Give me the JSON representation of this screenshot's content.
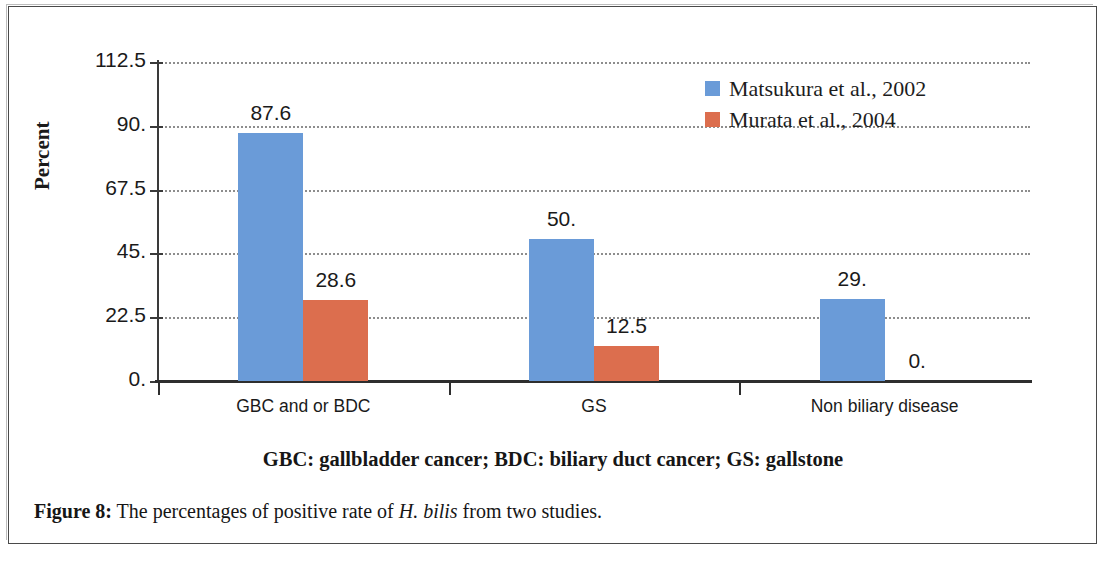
{
  "figure": {
    "caption_prefix": "Figure 8:",
    "caption_text_1": " The percentages of positive rate of ",
    "caption_italic": "H. bilis",
    "caption_text_2": " from two studies.",
    "subtitle": "GBC: gallbladder cancer; BDC: biliary duct cancer; GS: gallstone"
  },
  "chart_data": {
    "type": "bar",
    "title": "",
    "xlabel": "",
    "ylabel": "Percent",
    "ylim": [
      0,
      112.5
    ],
    "yticks": [
      "0.",
      "22.5",
      "45.",
      "67.5",
      "90.",
      "112.5"
    ],
    "ytick_values": [
      0,
      22.5,
      45,
      67.5,
      90,
      112.5
    ],
    "grid": true,
    "legend_position": "top-right",
    "categories": [
      "GBC and or BDC",
      "GS",
      "Non biliary disease"
    ],
    "series": [
      {
        "name": "Matsukura et al., 2002",
        "color": "#6a9bd8",
        "values": [
          87.6,
          50.0,
          29.0
        ],
        "labels": [
          "87.6",
          "50.",
          "29."
        ]
      },
      {
        "name": "Murata et al., 2004",
        "color": "#dc6e4e",
        "values": [
          28.6,
          12.5,
          0.0
        ],
        "labels": [
          "28.6",
          "12.5",
          "0."
        ]
      }
    ]
  },
  "colors": {
    "series_blue": "#6a9bd8",
    "series_orange": "#dc6e4e",
    "axis": "#2e2e2e",
    "gridline": "#8d8d8d",
    "text": "#1a1a1a"
  }
}
